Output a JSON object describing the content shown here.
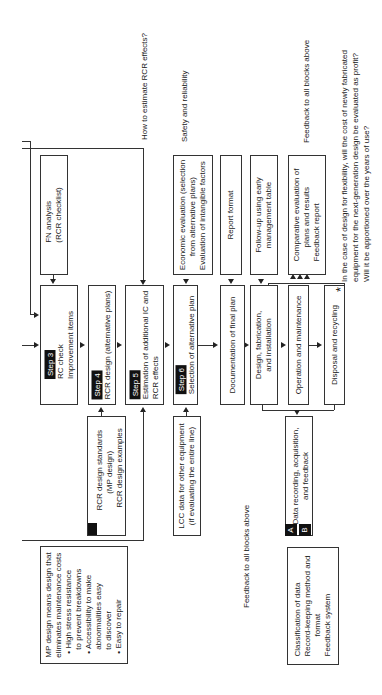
{
  "annotations": {
    "rcr_effects_question": "How to estimate RCR effects?",
    "safety": "Safety and reliability",
    "feedback_top": "Feedback to all blocks above",
    "feedback_bottom": "Feedback to all blocks above",
    "asterisk": "*",
    "footnote_lines": [
      "In the case of design for flexibility, will the cost of newly fabricated",
      "equipment for the next-generation design be evaluated as profit?",
      "Will it be apportioned over the years of use?"
    ]
  },
  "main_flow": {
    "step3": {
      "badge": "Step 3",
      "lines": [
        "RC check",
        "Improvement items"
      ]
    },
    "step4": {
      "badge": "Step 4",
      "lines": [
        "RCR design (alternative plans)"
      ]
    },
    "step5": {
      "badge": "Step 5",
      "lines": [
        "Estimation of additional IC and",
        "RCR effects"
      ]
    },
    "step6": {
      "badge": "Step 6",
      "lines": [
        "Selection of alternative plan"
      ]
    },
    "documentation": {
      "lines": [
        "Documentation of final plan"
      ]
    },
    "design_fab": {
      "lines": [
        "Design, fabrication,",
        "and installation"
      ]
    },
    "operation": {
      "lines": [
        "Operation and maintenance"
      ]
    },
    "disposal": {
      "lines": [
        "Disposal and recycling"
      ]
    }
  },
  "upper_inputs": {
    "fn_analysis": {
      "lines": [
        "FN analysis",
        "(RCR checklist)"
      ]
    },
    "economic": {
      "lines": [
        "Economic evaluation (selection",
        "from alternative plans)",
        "Evaluation of intangible factors"
      ]
    },
    "report_format": {
      "lines": [
        "Report format"
      ]
    },
    "follow_up": {
      "lines": [
        "Follow-up using early",
        "management table"
      ]
    },
    "comparative": {
      "lines": [
        "Comparative evaluation of",
        "plans and results",
        "Feedback report"
      ]
    }
  },
  "lower_inputs": {
    "rcr_standards": {
      "badge": "A",
      "lines": [
        "RCR design standards",
        "(MP design)",
        "RCR design examples"
      ]
    },
    "lcc_data": {
      "lines": [
        "LCC data for other equipment",
        "(if evaluating the entire line)"
      ]
    },
    "data_recording": {
      "badges": [
        "A",
        "B"
      ],
      "lines": [
        "Data recording, acquisition,",
        "and feedback"
      ]
    }
  },
  "notes": {
    "mp_design": {
      "lines": [
        "MP design means design that",
        "eliminates maintenance costs",
        "• High stress resistance",
        "   to prevent breakdowns",
        "• Accessibility to make",
        "   abnormalities easy",
        "   to discover",
        "• Easy to repair"
      ]
    },
    "classification": {
      "lines": [
        "Classification of data",
        "Record-keeping method and",
        "format",
        "Feedback system"
      ]
    }
  }
}
